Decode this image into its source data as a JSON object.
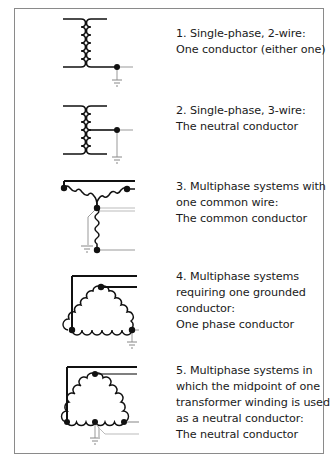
{
  "items": [
    {
      "number": "1",
      "lines": [
        "1. Single-phase, 2-wire:",
        "One conductor (either one)"
      ]
    },
    {
      "number": "2",
      "lines": [
        "2. Single-phase, 3-wire:",
        "The neutral conductor"
      ]
    },
    {
      "number": "3",
      "lines": [
        "3. Multiphase systems with",
        "one common wire:",
        "The common conductor"
      ]
    },
    {
      "number": "4",
      "lines": [
        "4. Multiphase systems",
        "requiring one grounded",
        "conductor:",
        "One phase conductor"
      ]
    },
    {
      "number": "5",
      "lines": [
        "5. Multiphase systems in",
        "which the midpoint of one",
        "transformer winding is used",
        "as a neutral conductor:",
        "The neutral conductor"
      ]
    }
  ],
  "colors": {
    "wire": "#111111",
    "ground_wire": "#a8a8a8",
    "frame": "#8a8a8a"
  }
}
